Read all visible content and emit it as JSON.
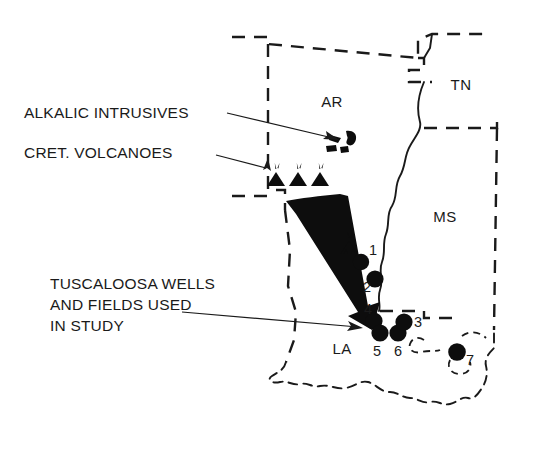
{
  "figure": {
    "background_color": "#ffffff",
    "ink_color": "#1a1a1a"
  },
  "annotations": [
    {
      "id": "alkalic-intrusives",
      "label": "ALKALIC INTRUSIVES",
      "points_to": "alkalic intrusive bodies in southern Arkansas"
    },
    {
      "id": "cret-volcanoes",
      "label": "CRET. VOLCANOES",
      "points_to": "Cretaceous volcano symbols on the Arkansas-Louisiana border"
    },
    {
      "id": "tuscaloosa-wells",
      "label_lines": [
        "TUSCALOOSA WELLS",
        "AND FIELDS USED",
        "IN STUDY"
      ],
      "points_to": "numbered well and field locations in Louisiana"
    }
  ],
  "states": [
    {
      "code": "AR",
      "name": "Arkansas",
      "x": 340,
      "y": 102
    },
    {
      "code": "TN",
      "name": "Tennessee",
      "x": 460,
      "y": 89
    },
    {
      "code": "MS",
      "name": "Mississippi",
      "x": 442,
      "y": 220
    },
    {
      "code": "LA",
      "name": "Louisiana",
      "x": 341,
      "y": 351
    }
  ],
  "well_sites": [
    {
      "number": "1",
      "cx": 361,
      "cy": 262,
      "r": 8.2,
      "label_x": 369,
      "label_y": 255
    },
    {
      "number": "2",
      "cx": 375,
      "cy": 279,
      "r": 8.6,
      "label_x": 363,
      "label_y": 288
    },
    {
      "number": "3",
      "cx": 404,
      "cy": 322,
      "r": 8.6,
      "label_x": 414,
      "label_y": 326
    },
    {
      "number": "4",
      "cx": 374,
      "cy": 321,
      "r": 8.6,
      "label_x": 364,
      "label_y": 314
    },
    {
      "number": "5",
      "cx": 380,
      "cy": 333,
      "r": 8.6,
      "label_x": 373,
      "label_y": 355
    },
    {
      "number": "6",
      "cx": 398,
      "cy": 333,
      "r": 8.6,
      "label_x": 394,
      "label_y": 355
    },
    {
      "number": "7",
      "cx": 457,
      "cy": 352,
      "r": 8.8,
      "label_x": 466,
      "label_y": 363
    }
  ],
  "volcano_symbols": [
    {
      "id": "volcano-west-1",
      "x": 276,
      "y": 172
    },
    {
      "id": "volcano-west-2",
      "x": 298,
      "y": 172
    },
    {
      "id": "volcano-west-3",
      "x": 320,
      "y": 172
    },
    {
      "id": "volcano-jackson-dome",
      "x": 349,
      "y": 241
    }
  ],
  "intrusive_bodies": [
    {
      "id": "intrusive-main",
      "cx": 350,
      "cy": 138
    },
    {
      "id": "intrusive-small-1",
      "cx": 331,
      "cy": 148
    },
    {
      "id": "intrusive-small-2",
      "cx": 340,
      "cy": 150
    },
    {
      "id": "intrusive-small-3",
      "cx": 348,
      "cy": 149
    }
  ],
  "migration_arrow": {
    "id": "migration-pathway-arrow",
    "description": "Large tapering black wedge arrow from southern Arkansas trending southeast to the Louisiana well cluster"
  }
}
